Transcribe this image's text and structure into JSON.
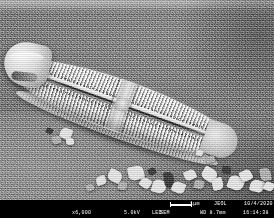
{
  "image": {
    "kind": "sem-micrograph",
    "specimen": "pennate diatom frustule with mineral debris",
    "background_tone": "#7c7c7c",
    "frustule_highlight": "#f4f4f4"
  },
  "infobar": {
    "background": "#000000",
    "text_color": "#ffffff",
    "magnification": "x6,000",
    "accel_voltage": "5.0kV",
    "detector_upper": "LED",
    "detector_lower": "SEM",
    "scale_label": "1µm",
    "manufacturer": "JEOL",
    "date": "10/4/2020",
    "working_distance": "WD 8.7mm",
    "time": "16:14:38"
  },
  "debris": [
    {
      "x": 96,
      "y": 176,
      "w": 10,
      "h": 9,
      "r": -18,
      "tone": "light"
    },
    {
      "x": 108,
      "y": 170,
      "w": 14,
      "h": 12,
      "r": 26,
      "tone": "light"
    },
    {
      "x": 118,
      "y": 182,
      "w": 9,
      "h": 8,
      "r": 10,
      "tone": "mid"
    },
    {
      "x": 128,
      "y": 166,
      "w": 16,
      "h": 14,
      "r": -12,
      "tone": "light"
    },
    {
      "x": 140,
      "y": 178,
      "w": 11,
      "h": 10,
      "r": 35,
      "tone": "light"
    },
    {
      "x": 148,
      "y": 168,
      "w": 8,
      "h": 7,
      "r": -30,
      "tone": "dark"
    },
    {
      "x": 152,
      "y": 180,
      "w": 14,
      "h": 13,
      "r": 16,
      "tone": "light"
    },
    {
      "x": 164,
      "y": 172,
      "w": 10,
      "h": 16,
      "r": -8,
      "tone": "dark"
    },
    {
      "x": 172,
      "y": 182,
      "w": 13,
      "h": 11,
      "r": 22,
      "tone": "light"
    },
    {
      "x": 184,
      "y": 170,
      "w": 12,
      "h": 10,
      "r": -24,
      "tone": "light"
    },
    {
      "x": 194,
      "y": 180,
      "w": 10,
      "h": 9,
      "r": 12,
      "tone": "mid"
    },
    {
      "x": 202,
      "y": 168,
      "w": 15,
      "h": 13,
      "r": 30,
      "tone": "light"
    },
    {
      "x": 212,
      "y": 178,
      "w": 11,
      "h": 12,
      "r": -16,
      "tone": "light"
    },
    {
      "x": 222,
      "y": 166,
      "w": 9,
      "h": 8,
      "r": 8,
      "tone": "dark"
    },
    {
      "x": 228,
      "y": 176,
      "w": 16,
      "h": 14,
      "r": 20,
      "tone": "light"
    },
    {
      "x": 240,
      "y": 170,
      "w": 12,
      "h": 11,
      "r": -28,
      "tone": "light"
    },
    {
      "x": 250,
      "y": 180,
      "w": 14,
      "h": 12,
      "r": 14,
      "tone": "light"
    },
    {
      "x": 260,
      "y": 168,
      "w": 11,
      "h": 13,
      "r": -10,
      "tone": "mid"
    },
    {
      "x": 264,
      "y": 182,
      "w": 10,
      "h": 9,
      "r": 24,
      "tone": "light"
    },
    {
      "x": 86,
      "y": 184,
      "w": 8,
      "h": 7,
      "r": -20,
      "tone": "mid"
    },
    {
      "x": 60,
      "y": 128,
      "w": 12,
      "h": 11,
      "r": 18,
      "tone": "light"
    },
    {
      "x": 52,
      "y": 136,
      "w": 9,
      "h": 8,
      "r": -14,
      "tone": "mid"
    },
    {
      "x": 46,
      "y": 128,
      "w": 7,
      "h": 6,
      "r": 30,
      "tone": "dark"
    },
    {
      "x": 66,
      "y": 138,
      "w": 8,
      "h": 7,
      "r": -6,
      "tone": "light"
    },
    {
      "x": 196,
      "y": 150,
      "w": 7,
      "h": 6,
      "r": 12,
      "tone": "light"
    },
    {
      "x": 206,
      "y": 156,
      "w": 9,
      "h": 7,
      "r": -22,
      "tone": "mid"
    }
  ]
}
